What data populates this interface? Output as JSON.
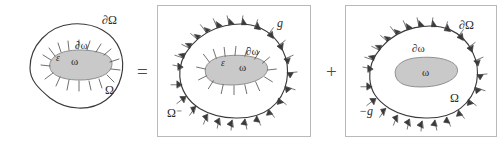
{
  "figure": {
    "operators": {
      "equals": "=",
      "plus": "+"
    },
    "colors": {
      "outline": "#3a3a3a",
      "inclusion_fill": "#c9c9c9",
      "inclusion_outline": "#8f8f8f",
      "frame": "#b9b9b9",
      "label": "#2b2b2b",
      "operator": "#4a4a4a",
      "background": "#ffffff"
    },
    "panels": [
      {
        "id": "panel-left",
        "name": "original-problem",
        "framed": false,
        "labels": [
          {
            "id": "outer-boundary",
            "text": "∂Ω",
            "style": "greek",
            "size": "sz-big",
            "x": 102,
            "y": 14
          },
          {
            "id": "outer-domain",
            "text": "Ω",
            "style": "greek",
            "size": "sz-big",
            "x": 105,
            "y": 84
          },
          {
            "id": "inner-boundary",
            "text": "∂ω",
            "style": "greek",
            "size": "sz-mid",
            "x": 75,
            "y": 40
          },
          {
            "id": "inner-domain",
            "text": "ω",
            "style": "greek",
            "size": "sz-mid",
            "x": 71,
            "y": 56
          },
          {
            "id": "epsilon-source",
            "text": "ε",
            "style": "italic",
            "size": "sz-small",
            "x": 56,
            "y": 54
          }
        ],
        "has_inner_flux": true,
        "has_outer_flux": false
      },
      {
        "id": "panel-middle",
        "name": "interior-flux-problem",
        "framed": true,
        "labels": [
          {
            "id": "outer-flux-g",
            "text": "g",
            "style": "italic",
            "size": "sz-big",
            "x": 276,
            "y": 22
          },
          {
            "id": "exterior-domain",
            "text": "Ω⁻",
            "style": "greek",
            "size": "sz-big",
            "x": 166,
            "y": 112
          },
          {
            "id": "inner-boundary",
            "text": "∂ω",
            "style": "greek",
            "size": "sz-mid",
            "x": 245,
            "y": 51
          },
          {
            "id": "inner-domain",
            "text": "ω",
            "style": "greek",
            "size": "sz-mid",
            "x": 238,
            "y": 67
          },
          {
            "id": "epsilon-source",
            "text": "ε",
            "style": "italic",
            "size": "sz-small",
            "x": 220,
            "y": 64
          }
        ],
        "has_inner_flux": true,
        "has_outer_flux": true
      },
      {
        "id": "panel-right",
        "name": "negative-flux-problem",
        "framed": true,
        "labels": [
          {
            "id": "outer-boundary",
            "text": "∂Ω",
            "style": "greek",
            "size": "sz-big",
            "x": 462,
            "y": 24
          },
          {
            "id": "outer-domain",
            "text": "Ω",
            "style": "greek",
            "size": "sz-big",
            "x": 452,
            "y": 96
          },
          {
            "id": "outer-flux-neg",
            "text": "−g",
            "style": "italic",
            "size": "sz-big",
            "x": 360,
            "y": 110
          },
          {
            "id": "inner-boundary",
            "text": "∂ω",
            "style": "greek",
            "size": "sz-mid",
            "x": 415,
            "y": 48
          },
          {
            "id": "inner-domain",
            "text": "ω",
            "style": "greek",
            "size": "sz-mid",
            "x": 423,
            "y": 70
          }
        ],
        "has_inner_flux": false,
        "has_outer_flux": true
      }
    ]
  }
}
